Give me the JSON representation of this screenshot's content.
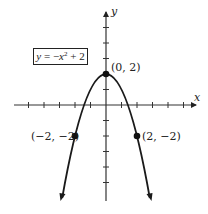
{
  "diagram": {
    "type": "function-graph",
    "equation": {
      "lhs": "y",
      "equals": " = −",
      "var": "x",
      "exponent": "2",
      "rest": " + 2",
      "full": "y = −x^2 + 2"
    },
    "axes": {
      "x_label": "x",
      "y_label": "y",
      "x_range": [
        -6,
        6
      ],
      "y_range": [
        -6,
        6
      ],
      "tick_step": 1
    },
    "points": [
      {
        "label": "(0, 2)",
        "x": 0,
        "y": 2
      },
      {
        "label": "(−2, −2)",
        "x": -2,
        "y": -2
      },
      {
        "label": "(2, −2)",
        "x": 2,
        "y": -2
      }
    ],
    "colors": {
      "curve": "#1a1a1a",
      "axes": "#333333",
      "background": "#ffffff"
    }
  }
}
